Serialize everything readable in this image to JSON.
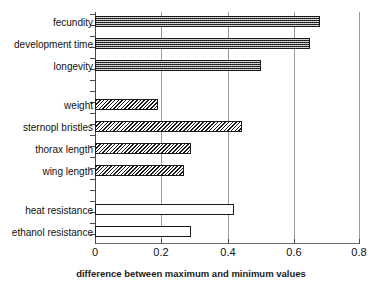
{
  "chart_data": {
    "type": "bar",
    "orientation": "horizontal",
    "title": "",
    "xlabel": "difference between maximum and minimum values",
    "ylabel": "",
    "xlim": [
      0,
      0.8
    ],
    "xticks": [
      "0",
      "0.2",
      "0.4",
      "0.6",
      "0.8"
    ],
    "xtick_values": [
      0,
      0.2,
      0.4,
      0.6,
      0.8
    ],
    "grid": true,
    "grid_axis": "x",
    "legend": "none",
    "categories": [
      "fecundity",
      "development time",
      "longevity",
      "weight",
      "sternopl bristles",
      "thorax length",
      "wing length",
      "heat resistance",
      "ethanol resistance"
    ],
    "values": [
      0.68,
      0.65,
      0.5,
      0.19,
      0.445,
      0.29,
      0.27,
      0.42,
      0.29
    ],
    "groups": [
      {
        "name": "life-history traits",
        "fill": "stipple",
        "items": [
          {
            "label": "fecundity",
            "value": 0.68
          },
          {
            "label": "development time",
            "value": 0.65
          },
          {
            "label": "longevity",
            "value": 0.5
          }
        ]
      },
      {
        "name": "morphological traits",
        "fill": "hatch",
        "items": [
          {
            "label": "weight",
            "value": 0.19
          },
          {
            "label": "sternopl bristles",
            "value": 0.445
          },
          {
            "label": "thorax length",
            "value": 0.29
          },
          {
            "label": "wing length",
            "value": 0.27
          }
        ]
      },
      {
        "name": "stress resistance traits",
        "fill": "open",
        "items": [
          {
            "label": "heat resistance",
            "value": 0.42
          },
          {
            "label": "ethanol resistance",
            "value": 0.29
          }
        ]
      }
    ],
    "colors": {
      "stipple_fill": "#6d6d6d",
      "hatch_fill": "#ffffff",
      "open_fill": "#ffffff",
      "bar_outline": "#1a1a1a",
      "gridline": "#9a9a9a",
      "axis": "#4a4a4a",
      "text": "#111111",
      "background": "#ffffff"
    }
  }
}
